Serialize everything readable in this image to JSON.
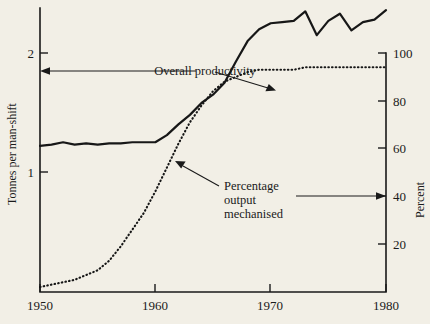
{
  "chart_data": {
    "type": "line",
    "title": "",
    "subtitle": "",
    "xlabel": "",
    "ylabel": "Tonnes per man-shift",
    "y2label": "Percent",
    "xlim": [
      1950,
      1980
    ],
    "ylim": [
      0.4,
      2.4
    ],
    "y2lim": [
      0,
      105
    ],
    "grid": false,
    "legend_position": "inline-annotations",
    "x_ticks": [
      1950,
      1960,
      1970,
      1980
    ],
    "x_tick_labels": [
      "1950",
      "1960",
      "1970",
      "1980"
    ],
    "y_ticks": [
      1,
      2
    ],
    "y_tick_labels": [
      "1",
      "2"
    ],
    "y2_ticks": [
      20,
      40,
      60,
      80,
      100
    ],
    "y2_tick_labels": [
      "20",
      "40",
      "60",
      "80",
      "100"
    ],
    "annotations": [
      {
        "name": "overall-productivity-annotation",
        "text": "Overall productivity",
        "text_lines": [
          "Overall productivity"
        ]
      },
      {
        "name": "percentage-output-mechanised-annotation",
        "text": "Percentage output mechanised",
        "text_lines": [
          "Percentage",
          "output",
          "mechanised"
        ]
      }
    ],
    "series": [
      {
        "name": "Overall productivity",
        "style": "solid",
        "axis": "left",
        "units": "Tonnes per man-shift",
        "x": [
          1950,
          1951,
          1952,
          1953,
          1954,
          1955,
          1956,
          1957,
          1958,
          1959,
          1960,
          1961,
          1962,
          1963,
          1964,
          1965,
          1966,
          1967,
          1968,
          1969,
          1970,
          1971,
          1972,
          1973,
          1974,
          1975,
          1976,
          1977,
          1978,
          1979,
          1980
        ],
        "values": [
          1.22,
          1.23,
          1.25,
          1.23,
          1.24,
          1.23,
          1.24,
          1.24,
          1.25,
          1.25,
          1.25,
          1.31,
          1.4,
          1.48,
          1.58,
          1.65,
          1.75,
          1.93,
          2.1,
          2.2,
          2.25,
          2.26,
          2.27,
          2.35,
          2.15,
          2.27,
          2.33,
          2.19,
          2.26,
          2.28,
          2.36
        ]
      },
      {
        "name": "Percentage output mechanised",
        "style": "dotted",
        "axis": "right",
        "units": "Percent",
        "x": [
          1950,
          1951,
          1952,
          1953,
          1954,
          1955,
          1956,
          1957,
          1958,
          1959,
          1960,
          1961,
          1962,
          1963,
          1964,
          1965,
          1966,
          1967,
          1968,
          1969,
          1970,
          1971,
          1972,
          1973,
          1974,
          1975,
          1976,
          1977,
          1978,
          1979,
          1980
        ],
        "values": [
          2,
          3,
          4,
          5,
          7,
          9,
          13,
          19,
          26,
          33,
          42,
          52,
          62,
          71,
          78,
          84,
          88,
          90,
          92,
          93,
          93,
          93,
          93,
          94,
          94,
          94,
          94,
          94,
          94,
          94,
          94
        ]
      }
    ]
  },
  "colors": {
    "background": "#f2efe6",
    "ink": "#1a1a1a",
    "series": "#171717"
  }
}
